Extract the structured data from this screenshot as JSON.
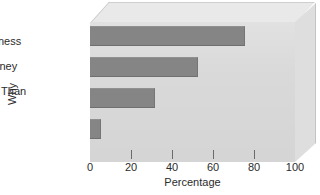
{
  "chart_data": {
    "type": "bar",
    "orientation": "horizontal",
    "title": "",
    "xlabel": "Percentage",
    "ylabel": "Why",
    "xlim": [
      0,
      100
    ],
    "xticks": [
      0,
      20,
      40,
      60,
      80,
      100
    ],
    "grid": false,
    "legend": null,
    "categories": [
      "Increase\nEffectiveness",
      "Save Money",
      "Cheaper Than\nNotes",
      "Other"
    ],
    "values": [
      75,
      52,
      31,
      5
    ],
    "series": [
      {
        "name": "Percentage",
        "values": [
          75,
          52,
          31,
          5
        ]
      }
    ]
  },
  "style": {
    "bar_color": "#858585",
    "panel_color": "#d9d9d9",
    "panel_top_color": "#e9e9e9",
    "panel_side_color": "#dedede",
    "background": "#ffffff",
    "text_color": "#2b2b2b"
  },
  "axis": {
    "x_title": "Percentage",
    "y_title": "Why",
    "tick_labels": [
      "0",
      "20",
      "40",
      "60",
      "80",
      "100"
    ]
  },
  "bars": [
    {
      "label": "Increase\nEffectiveness",
      "value": 75
    },
    {
      "label": "Save Money",
      "value": 52
    },
    {
      "label": "Cheaper Than\nNotes",
      "value": 31
    },
    {
      "label": "Other",
      "value": 5
    }
  ]
}
